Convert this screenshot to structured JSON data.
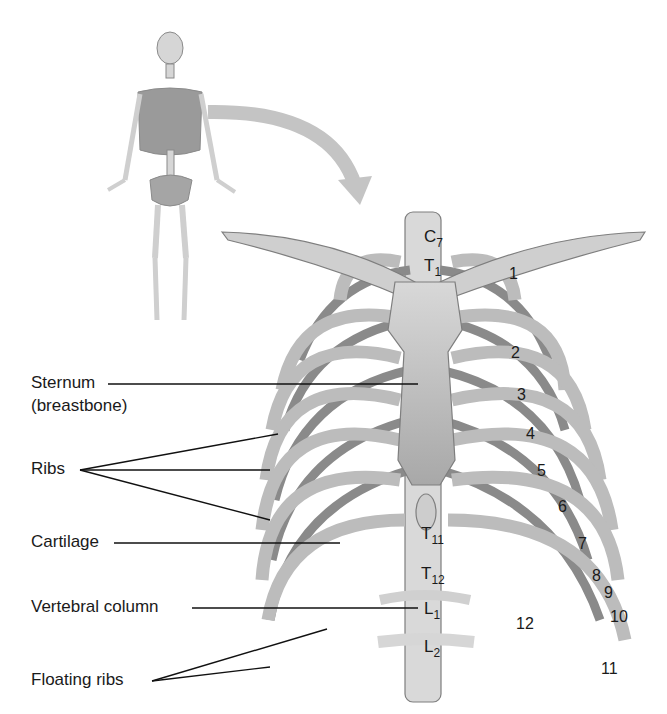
{
  "figure": {
    "inset": "Full human skeleton with thoracic cage highlighted",
    "colors": {
      "bone": "#c9c9c9",
      "bone_dark": "#8f8f8f",
      "cartilage": "#b3b3b3",
      "line": "#111111",
      "arrow": "#bdbdbd"
    }
  },
  "labels": {
    "sternum_line1": "Sternum",
    "sternum_line2": "(breastbone)",
    "ribs": "Ribs",
    "cartilage": "Cartilage",
    "vertebral_column": "Vertebral column",
    "floating_ribs": "Floating ribs"
  },
  "vertebrae": [
    {
      "letter": "C",
      "sub": "7"
    },
    {
      "letter": "T",
      "sub": "1"
    },
    {
      "letter": "T",
      "sub": "11"
    },
    {
      "letter": "T",
      "sub": "12"
    },
    {
      "letter": "L",
      "sub": "1"
    },
    {
      "letter": "L",
      "sub": "2"
    }
  ],
  "rib_numbers": [
    "1",
    "2",
    "3",
    "4",
    "5",
    "6",
    "7",
    "8",
    "9",
    "10",
    "11",
    "12"
  ]
}
